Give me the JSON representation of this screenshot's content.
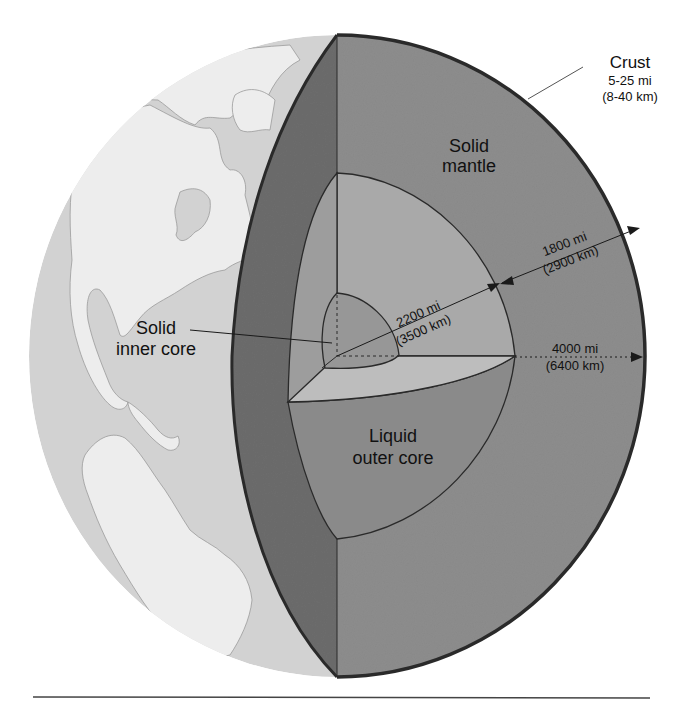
{
  "diagram": {
    "colors": {
      "background": "#ffffff",
      "ocean": "#d2d2d2",
      "land": "#ededed",
      "crust_cut": "#6c6c6c",
      "mantle": "#8d8d8d",
      "outer_core_light": "#a9a9a9",
      "outer_core_dark": "#8a8a8a",
      "inner_core": "#979797",
      "cut_face_light": "#b9b9b9",
      "outline": "#2a2a2a"
    },
    "labels": {
      "crust": {
        "title": "Crust",
        "line1": "5-25 mi",
        "line2": "(8-40 km)"
      },
      "mantle": {
        "line1": "Solid",
        "line2": "mantle"
      },
      "inner_core": {
        "line1": "Solid",
        "line2": "inner core"
      },
      "outer_core": {
        "line1": "Liquid",
        "line2": "outer core"
      }
    },
    "measurements": {
      "mantle_thickness": {
        "mi": "1800 mi",
        "km": "(2900 km)"
      },
      "core_radius": {
        "mi": "2200 mi",
        "km": "(3500 km)"
      },
      "earth_radius": {
        "mi": "4000 mi",
        "km": "(6400 km)"
      }
    }
  }
}
